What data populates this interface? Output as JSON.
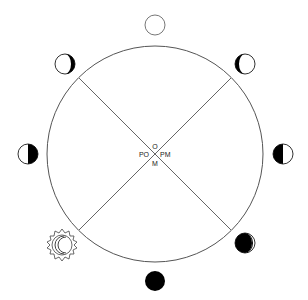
{
  "diagram": {
    "center_labels": {
      "top": "O",
      "left": "PO",
      "right": "PM",
      "bottom": "M"
    },
    "phases": [
      {
        "position": "top",
        "phase": "full-moon"
      },
      {
        "position": "top-right",
        "phase": "waning-gibbous"
      },
      {
        "position": "right",
        "phase": "last-quarter"
      },
      {
        "position": "bottom-right",
        "phase": "waning-crescent"
      },
      {
        "position": "bottom",
        "phase": "new-moon"
      },
      {
        "position": "bottom-left",
        "phase": "solar-eclipse-crescent"
      },
      {
        "position": "left",
        "phase": "first-quarter"
      },
      {
        "position": "top-left",
        "phase": "waxing-gibbous"
      }
    ],
    "colors": {
      "stroke": "#555555",
      "fill_dark": "#000000",
      "fill_light": "#ffffff"
    }
  }
}
